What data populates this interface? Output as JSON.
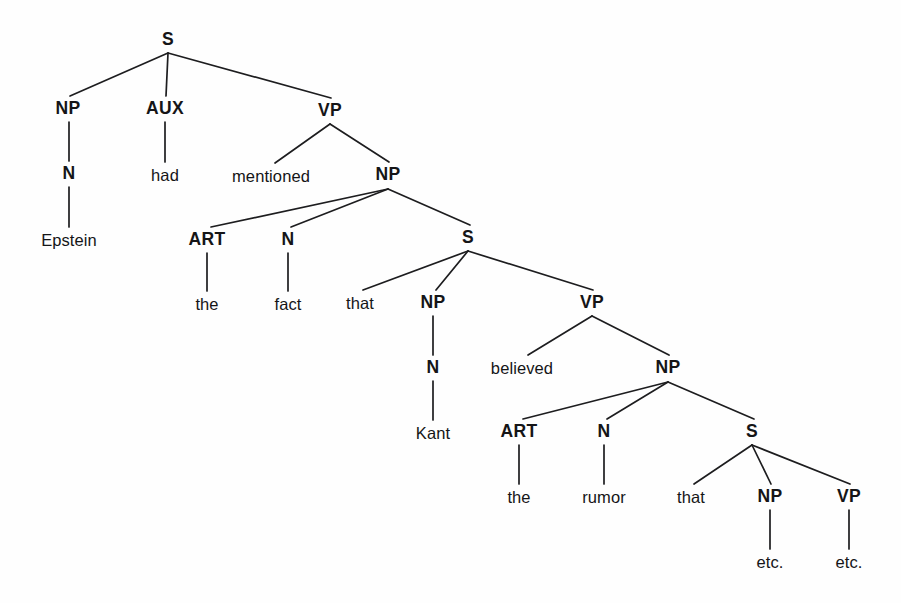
{
  "diagram": {
    "type": "syntax-tree",
    "sentence": "Epstein had mentioned the fact that Kant believed the rumor that NP VP etc.",
    "background_color": "#fefefe",
    "line_color": "#1d1d1f",
    "text_color": "#151517",
    "nodes": [
      {
        "id": "s1",
        "label": "S",
        "kind": "category",
        "x": 168,
        "y": 40
      },
      {
        "id": "np1",
        "label": "NP",
        "kind": "category",
        "x": 68,
        "y": 109
      },
      {
        "id": "aux1",
        "label": "AUX",
        "kind": "category",
        "x": 165,
        "y": 109
      },
      {
        "id": "vp1",
        "label": "VP",
        "kind": "category",
        "x": 330,
        "y": 111
      },
      {
        "id": "n1",
        "label": "N",
        "kind": "category",
        "x": 69,
        "y": 174
      },
      {
        "id": "had",
        "label": "had",
        "kind": "word",
        "x": 165,
        "y": 175
      },
      {
        "id": "mentioned",
        "label": "mentioned",
        "kind": "word",
        "x": 271,
        "y": 176
      },
      {
        "id": "np2",
        "label": "NP",
        "kind": "category",
        "x": 388,
        "y": 175
      },
      {
        "id": "epstein",
        "label": "Epstein",
        "kind": "word",
        "x": 69,
        "y": 240
      },
      {
        "id": "art1",
        "label": "ART",
        "kind": "category",
        "x": 207,
        "y": 240
      },
      {
        "id": "n2",
        "label": "N",
        "kind": "category",
        "x": 288,
        "y": 240
      },
      {
        "id": "s2",
        "label": "S",
        "kind": "category",
        "x": 468,
        "y": 238
      },
      {
        "id": "the1",
        "label": "the",
        "kind": "word",
        "x": 207,
        "y": 304
      },
      {
        "id": "fact",
        "label": "fact",
        "kind": "word",
        "x": 288,
        "y": 304
      },
      {
        "id": "that1",
        "label": "that",
        "kind": "word",
        "x": 360,
        "y": 303
      },
      {
        "id": "np3",
        "label": "NP",
        "kind": "category",
        "x": 433,
        "y": 303
      },
      {
        "id": "vp2",
        "label": "VP",
        "kind": "category",
        "x": 592,
        "y": 303
      },
      {
        "id": "n3",
        "label": "N",
        "kind": "category",
        "x": 433,
        "y": 368
      },
      {
        "id": "believed",
        "label": "believed",
        "kind": "word",
        "x": 522,
        "y": 368
      },
      {
        "id": "np4",
        "label": "NP",
        "kind": "category",
        "x": 668,
        "y": 368
      },
      {
        "id": "kant",
        "label": "Kant",
        "kind": "word",
        "x": 433,
        "y": 433
      },
      {
        "id": "art2",
        "label": "ART",
        "kind": "category",
        "x": 519,
        "y": 432
      },
      {
        "id": "n4",
        "label": "N",
        "kind": "category",
        "x": 604,
        "y": 432
      },
      {
        "id": "s3",
        "label": "S",
        "kind": "category",
        "x": 752,
        "y": 432
      },
      {
        "id": "the2",
        "label": "the",
        "kind": "word",
        "x": 519,
        "y": 497
      },
      {
        "id": "rumor",
        "label": "rumor",
        "kind": "word",
        "x": 604,
        "y": 497
      },
      {
        "id": "that2",
        "label": "that",
        "kind": "word",
        "x": 691,
        "y": 497
      },
      {
        "id": "np5",
        "label": "NP",
        "kind": "category",
        "x": 770,
        "y": 497
      },
      {
        "id": "vp3",
        "label": "VP",
        "kind": "category",
        "x": 849,
        "y": 497
      },
      {
        "id": "etc1",
        "label": "etc.",
        "kind": "word",
        "x": 770,
        "y": 562
      },
      {
        "id": "etc2",
        "label": "etc.",
        "kind": "word",
        "x": 849,
        "y": 562
      }
    ],
    "edges": [
      {
        "from": "s1",
        "to": "np1",
        "x1": 168,
        "y1": 53,
        "x2": 70,
        "y2": 96
      },
      {
        "from": "s1",
        "to": "aux1",
        "x1": 168,
        "y1": 53,
        "x2": 166,
        "y2": 96
      },
      {
        "from": "s1",
        "to": "vp1",
        "x1": 168,
        "y1": 53,
        "x2": 331,
        "y2": 98
      },
      {
        "from": "np1",
        "to": "n1",
        "x1": 69,
        "y1": 122,
        "x2": 69,
        "y2": 161
      },
      {
        "from": "aux1",
        "to": "had",
        "x1": 165,
        "y1": 122,
        "x2": 165,
        "y2": 162
      },
      {
        "from": "vp1",
        "to": "mentioned",
        "x1": 330,
        "y1": 124,
        "x2": 275,
        "y2": 163
      },
      {
        "from": "vp1",
        "to": "np2",
        "x1": 330,
        "y1": 124,
        "x2": 389,
        "y2": 162
      },
      {
        "from": "n1",
        "to": "epstein",
        "x1": 69,
        "y1": 187,
        "x2": 69,
        "y2": 227
      },
      {
        "from": "np2",
        "to": "art1",
        "x1": 388,
        "y1": 189,
        "x2": 211,
        "y2": 227
      },
      {
        "from": "np2",
        "to": "n2",
        "x1": 388,
        "y1": 189,
        "x2": 291,
        "y2": 227
      },
      {
        "from": "np2",
        "to": "s2",
        "x1": 388,
        "y1": 189,
        "x2": 470,
        "y2": 225
      },
      {
        "from": "art1",
        "to": "the1",
        "x1": 207,
        "y1": 253,
        "x2": 207,
        "y2": 291
      },
      {
        "from": "n2",
        "to": "fact",
        "x1": 288,
        "y1": 253,
        "x2": 288,
        "y2": 291
      },
      {
        "from": "s2",
        "to": "that1",
        "x1": 468,
        "y1": 251,
        "x2": 363,
        "y2": 290
      },
      {
        "from": "s2",
        "to": "np3",
        "x1": 468,
        "y1": 251,
        "x2": 436,
        "y2": 290
      },
      {
        "from": "s2",
        "to": "vp2",
        "x1": 468,
        "y1": 251,
        "x2": 593,
        "y2": 290
      },
      {
        "from": "np3",
        "to": "n3",
        "x1": 433,
        "y1": 316,
        "x2": 433,
        "y2": 355
      },
      {
        "from": "vp2",
        "to": "believed",
        "x1": 592,
        "y1": 316,
        "x2": 528,
        "y2": 355
      },
      {
        "from": "vp2",
        "to": "np4",
        "x1": 592,
        "y1": 316,
        "x2": 669,
        "y2": 355
      },
      {
        "from": "n3",
        "to": "kant",
        "x1": 433,
        "y1": 381,
        "x2": 433,
        "y2": 420
      },
      {
        "from": "np4",
        "to": "art2",
        "x1": 668,
        "y1": 382,
        "x2": 523,
        "y2": 419
      },
      {
        "from": "np4",
        "to": "n4",
        "x1": 668,
        "y1": 382,
        "x2": 607,
        "y2": 419
      },
      {
        "from": "np4",
        "to": "s3",
        "x1": 668,
        "y1": 382,
        "x2": 754,
        "y2": 419
      },
      {
        "from": "art2",
        "to": "the2",
        "x1": 519,
        "y1": 445,
        "x2": 519,
        "y2": 484
      },
      {
        "from": "n4",
        "to": "rumor",
        "x1": 604,
        "y1": 445,
        "x2": 604,
        "y2": 484
      },
      {
        "from": "s3",
        "to": "that2",
        "x1": 752,
        "y1": 445,
        "x2": 694,
        "y2": 484
      },
      {
        "from": "s3",
        "to": "np5",
        "x1": 752,
        "y1": 445,
        "x2": 771,
        "y2": 484
      },
      {
        "from": "s3",
        "to": "vp3",
        "x1": 752,
        "y1": 445,
        "x2": 850,
        "y2": 484
      },
      {
        "from": "np5",
        "to": "etc1",
        "x1": 770,
        "y1": 510,
        "x2": 770,
        "y2": 549
      },
      {
        "from": "vp3",
        "to": "etc2",
        "x1": 849,
        "y1": 510,
        "x2": 849,
        "y2": 549
      }
    ]
  }
}
